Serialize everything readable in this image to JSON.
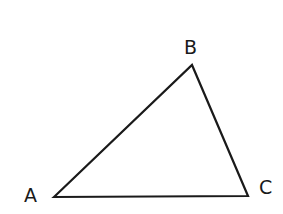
{
  "diagram": {
    "type": "triangle",
    "vertices": [
      {
        "label": "A",
        "x": 54,
        "y": 197
      },
      {
        "label": "B",
        "x": 192,
        "y": 65
      },
      {
        "label": "C",
        "x": 248,
        "y": 196
      }
    ],
    "stroke_color": "#1a1a1a",
    "labels": {
      "a": "A",
      "b": "B",
      "c": "C"
    }
  }
}
